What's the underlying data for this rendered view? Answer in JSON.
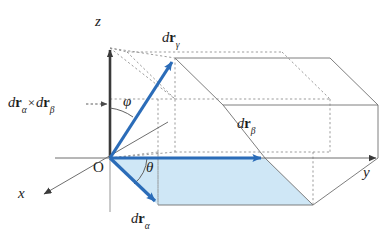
{
  "figure": {
    "background_color": "#ffffff"
  },
  "colors": {
    "vector_blue": "#2b6cb8",
    "shaded_fill": "#cfe7f6",
    "axis_dark": "#3a3a3a",
    "wireframe_gray": "#6f6f6f",
    "dotted_gray": "#8a8a8a",
    "text": "#1d1d1d"
  },
  "axes": {
    "z": {
      "label": "z",
      "origin_label": "O"
    },
    "y": {
      "label": "y"
    },
    "x": {
      "label": "x"
    }
  },
  "origin": {
    "label": "O"
  },
  "angles": {
    "phi": {
      "symbol": "φ",
      "between": "z-axis and dr_gamma"
    },
    "theta": {
      "symbol": "θ",
      "between": "y-axis and dr_alpha"
    }
  },
  "vectors": [
    {
      "name": "dr-gamma",
      "prefix": "d",
      "bold": "r",
      "subscript": "γ",
      "color": "#2b6cb8",
      "description": "resultant vector directed up and to the right"
    },
    {
      "name": "dr-beta",
      "prefix": "d",
      "bold": "r",
      "subscript": "β",
      "color": "#2b6cb8",
      "description": "vector along the y-axis"
    },
    {
      "name": "dr-alpha",
      "prefix": "d",
      "bold": "r",
      "subscript": "α",
      "color": "#2b6cb8",
      "description": "vector directed down and to the right toward x"
    }
  ],
  "cross_product_label": {
    "prefix1": "d",
    "bold1": "r",
    "sub1": "α",
    "operator": "×",
    "prefix2": "d",
    "bold2": "r",
    "sub2": "β",
    "pointer": "dashed-arrow-to-z-axis"
  },
  "shaded_region": {
    "name": "parallelogram-dr-alpha-dr-beta",
    "fill": "#cfe7f6",
    "description": "parallelogram spanned by dr_alpha and dr_beta"
  }
}
